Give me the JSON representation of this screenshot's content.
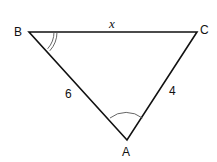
{
  "diagram": {
    "type": "triangle",
    "vertices": [
      {
        "name": "B",
        "x": 29,
        "y": 32
      },
      {
        "name": "C",
        "x": 197,
        "y": 32
      },
      {
        "name": "A",
        "x": 127,
        "y": 140
      }
    ],
    "side_labels": {
      "BC": "x",
      "AB": "6",
      "AC": "4"
    },
    "angle_marks": {
      "B": "double-arc",
      "A": "single-arc"
    },
    "line_color": "#111111"
  }
}
